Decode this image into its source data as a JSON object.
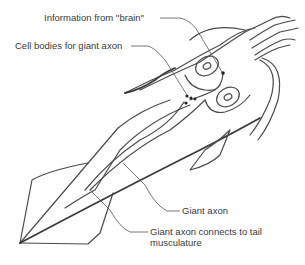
{
  "diagram": {
    "labels": {
      "information_from_brain": "Information from ''brain''",
      "cell_bodies": "Cell bodies for giant axon",
      "giant_axon": "Giant axon",
      "tail_connection_line1": "Giant axon connects to tail",
      "tail_connection_line2": "musculature"
    },
    "colors": {
      "line": "#4a4a4a",
      "text": "#3a3a3a",
      "background": "#ffffff"
    }
  }
}
